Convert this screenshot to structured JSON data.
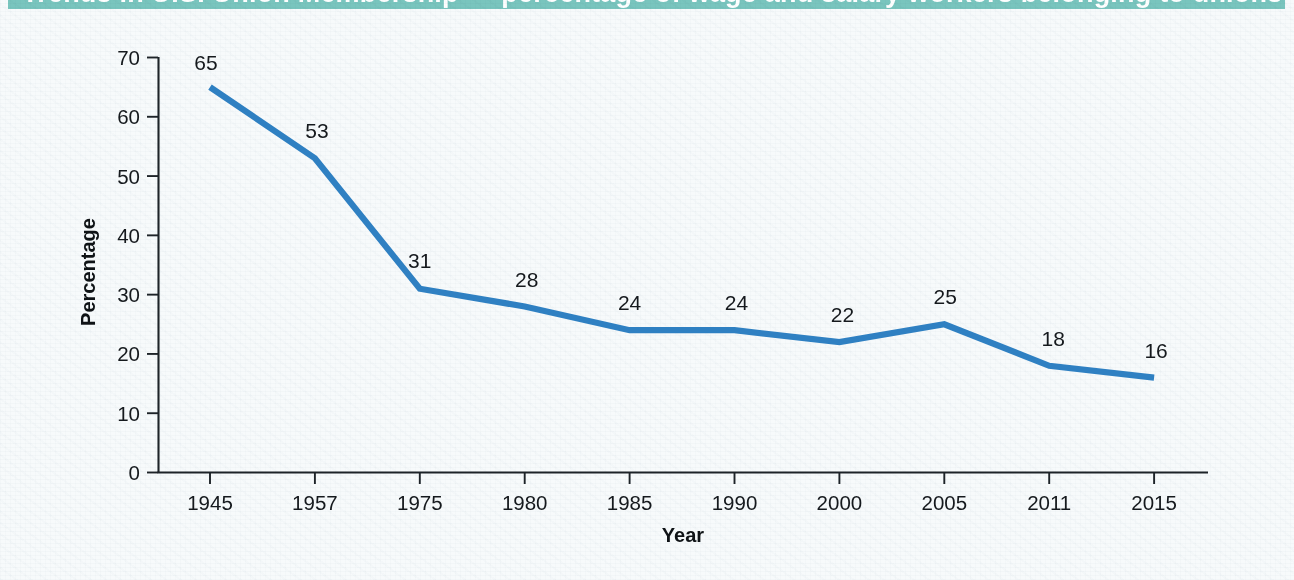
{
  "banner": {
    "title": "Trends in U.S. Union Membership — percentage of wage and salary workers belonging to unions"
  },
  "chart_data": {
    "type": "line",
    "title": "",
    "xlabel": "Year",
    "ylabel": "Percentage",
    "categories": [
      "1945",
      "1957",
      "1975",
      "1980",
      "1985",
      "1990",
      "2000",
      "2005",
      "2011",
      "2015"
    ],
    "values": [
      65,
      53,
      31,
      28,
      24,
      24,
      22,
      25,
      18,
      16
    ],
    "point_labels": [
      "65",
      "53",
      "31",
      "28",
      "24",
      "24",
      "22",
      "25",
      "18",
      "16"
    ],
    "ylim": [
      0,
      70
    ],
    "yticks": [
      "0",
      "10",
      "20",
      "30",
      "40",
      "50",
      "60",
      "70"
    ],
    "ytick_values": [
      0,
      10,
      20,
      30,
      40,
      50,
      60,
      70
    ],
    "grid": false,
    "legend": "none",
    "series_color": "#2f80c2",
    "axis_color": "#1d2328",
    "label_color": "#15191d",
    "background_color": "#f7fafb",
    "banner_color": "#79c5be"
  }
}
